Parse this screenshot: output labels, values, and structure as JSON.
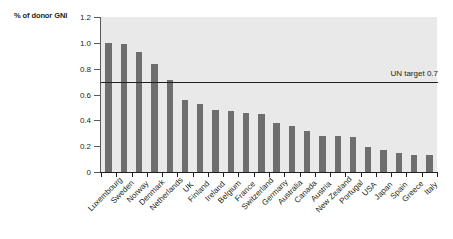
{
  "chart_data": {
    "type": "bar",
    "title": "",
    "subtitle": "",
    "xlabel": "",
    "ylabel": "% of donor GNI",
    "ylim": [
      0,
      1.2
    ],
    "ytick_labels": [
      "0",
      "0.2",
      "0.4",
      "0.6",
      "0.8",
      "1.0",
      "1.2"
    ],
    "ytick_values": [
      0,
      0.2,
      0.4,
      0.6,
      0.8,
      1.0,
      1.2
    ],
    "grid": false,
    "legend": null,
    "bar_color": "#6e6e6e",
    "plot_background": "#e9e9e9",
    "categories": [
      "Luxembourg",
      "Sweden",
      "Norway",
      "Denmark",
      "Netherlands",
      "UK",
      "Finland",
      "Ireland",
      "Belgium",
      "France",
      "Switzerland",
      "Germany",
      "Australia",
      "Canada",
      "Austria",
      "New Zealand",
      "Portugal",
      "USA",
      "Japan",
      "Spain",
      "Greece",
      "Italy"
    ],
    "values": [
      1.0,
      0.99,
      0.93,
      0.84,
      0.71,
      0.56,
      0.53,
      0.48,
      0.47,
      0.46,
      0.45,
      0.38,
      0.36,
      0.32,
      0.28,
      0.28,
      0.27,
      0.19,
      0.17,
      0.15,
      0.13,
      0.13
    ],
    "annotations": [
      {
        "name": "un-target-line",
        "label": "UN target 0.7",
        "value": 0.7,
        "orientation": "horizontal",
        "color": "#231f20"
      }
    ]
  }
}
